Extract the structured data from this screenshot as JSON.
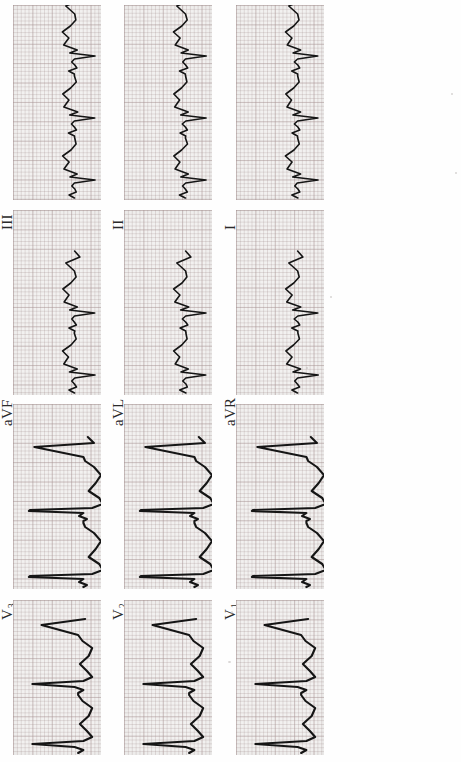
{
  "document": {
    "kind": "12-lead electrocardiogram scan",
    "orientation": "rotated 90 degrees counter-clockwise",
    "paper_color": "#f2f1f0",
    "grid_color": "#aa9696",
    "trace_color": "#151515",
    "background_color": "#fefefe"
  },
  "leads": [
    {
      "id": "III",
      "label": "III",
      "sub": "",
      "row": 0,
      "col": 0,
      "x": 13,
      "y": 5,
      "w": 86,
      "h": 193,
      "label_x": 16,
      "label_y": 237,
      "amplitude": "small",
      "morphology": "low-voltage multiphasic limb lead, notched QRS, beats every ~62px"
    },
    {
      "id": "II",
      "label": "II",
      "sub": "",
      "row": 0,
      "col": 1,
      "x": 123,
      "y": 5,
      "w": 86,
      "h": 193,
      "label_x": 126,
      "label_y": 237,
      "amplitude": "small",
      "morphology": "low-voltage multiphasic limb lead with sharp notches"
    },
    {
      "id": "I",
      "label": "I",
      "sub": "",
      "row": 0,
      "col": 2,
      "x": 237,
      "y": 5,
      "w": 86,
      "h": 193,
      "label_x": 240,
      "label_y": 237,
      "amplitude": "tall",
      "morphology": "precordial-type with tall sharp R spikes"
    },
    {
      "id": "V4",
      "label": "V",
      "sub": "4",
      "row": 0,
      "col": 3,
      "x": 349,
      "y": 5,
      "w": 86,
      "h": 193,
      "label_x": 352,
      "label_y": 237,
      "amplitude": "tall",
      "morphology": "tall narrow R waves with deep S"
    }
  ],
  "grid": {
    "rows": 4,
    "cols": 3,
    "panel_width": 86,
    "panel_height": 193,
    "small_box_px": 3.88,
    "large_box_px": 19.4
  },
  "layout": {
    "row_labels_bottom_offset": 39,
    "note": "labels sit below each panel, rotated -90 degrees"
  },
  "panels": [
    {
      "key": "III",
      "label": "III",
      "sub": "",
      "left": 13,
      "top": 5,
      "w": 88,
      "h": 195,
      "lx": 16,
      "ly": 247,
      "style": "limb"
    },
    {
      "key": "aVF",
      "label": "aVF",
      "sub": "",
      "left": 13,
      "top": 210,
      "w": 88,
      "h": 185,
      "lx": 16,
      "ly": 443,
      "style": "limb"
    },
    {
      "key": "V3",
      "label": "V",
      "sub": "3",
      "left": 13,
      "top": 404,
      "w": 88,
      "h": 185,
      "lx": 16,
      "ly": 637,
      "style": "precordial-big"
    },
    {
      "key": "V6",
      "label": "V",
      "sub": "6",
      "left": 13,
      "top": 600,
      "w": 88,
      "h": 155,
      "lx": 16,
      "ly": 800,
      "style": "precordial-mid"
    },
    {
      "key": "II",
      "label": "II",
      "sub": "",
      "left": 124,
      "top": 5,
      "w": 88,
      "h": 195,
      "lx": 127,
      "ly": 247,
      "style": "limb"
    },
    {
      "key": "aVL",
      "label": "aVL",
      "sub": "",
      "left": 124,
      "top": 210,
      "w": 88,
      "h": 185,
      "lx": 127,
      "ly": 443,
      "style": "limb"
    },
    {
      "key": "V2",
      "label": "V",
      "sub": "2",
      "left": 124,
      "top": 404,
      "w": 88,
      "h": 185,
      "lx": 127,
      "ly": 637,
      "style": "precordial-big"
    },
    {
      "key": "V5",
      "label": "V",
      "sub": "5",
      "left": 124,
      "top": 600,
      "w": 88,
      "h": 155,
      "lx": 127,
      "ly": 800,
      "style": "precordial-mid"
    },
    {
      "key": "I",
      "label": "I",
      "sub": "",
      "left": 236,
      "top": 5,
      "w": 88,
      "h": 195,
      "lx": 239,
      "ly": 247,
      "style": "limb"
    },
    {
      "key": "aVR",
      "label": "aVR",
      "sub": "",
      "left": 236,
      "top": 210,
      "w": 88,
      "h": 185,
      "lx": 239,
      "ly": 443,
      "style": "limb"
    },
    {
      "key": "V1",
      "label": "V",
      "sub": "1",
      "left": 236,
      "top": 404,
      "w": 88,
      "h": 185,
      "lx": 239,
      "ly": 637,
      "style": "precordial-big"
    },
    {
      "key": "V4",
      "label": "V",
      "sub": "4",
      "left": 236,
      "top": 600,
      "w": 88,
      "h": 155,
      "lx": 239,
      "ly": 800,
      "style": "precordial-mid"
    }
  ],
  "chart_data": {
    "type": "line",
    "xlabel": "",
    "ylabel": "",
    "note": "Traces drawn vertically because the sheet is rotated 90 degrees CCW; time runs bottom-to-top, voltage runs left-to-right.",
    "lead_order_columns": [
      [
        "III",
        "aVF",
        "V3",
        "V6"
      ],
      [
        "II",
        "aVL",
        "V2",
        "V5"
      ],
      [
        "I",
        "aVR",
        "V1",
        "V4"
      ]
    ],
    "paper_speed_mm_per_s": 25,
    "gain_mm_per_mV": 10,
    "beats_visible_per_panel": 3,
    "series": [
      {
        "name": "III",
        "amplitude_mV": 0.45,
        "qrs": "notched, low voltage"
      },
      {
        "name": "aVF",
        "amplitude_mV": 0.5,
        "qrs": "notched, low voltage"
      },
      {
        "name": "V3",
        "amplitude_mV": 1.8,
        "qrs": "tall R, deep S"
      },
      {
        "name": "V6",
        "amplitude_mV": 1.2,
        "qrs": "tall R"
      },
      {
        "name": "II",
        "amplitude_mV": 0.55,
        "qrs": "notched, low voltage"
      },
      {
        "name": "aVL",
        "amplitude_mV": 0.4,
        "qrs": "low voltage"
      },
      {
        "name": "V2",
        "amplitude_mV": 1.7,
        "qrs": "rS with tall spikes"
      },
      {
        "name": "V5",
        "amplitude_mV": 1.6,
        "qrs": "tall R"
      },
      {
        "name": "I",
        "amplitude_mV": 1.1,
        "qrs": "sharp narrow R"
      },
      {
        "name": "aVR",
        "amplitude_mV": 0.5,
        "qrs": "negative, notched"
      },
      {
        "name": "V1",
        "amplitude_mV": 1.4,
        "qrs": "rS, sharp spikes"
      },
      {
        "name": "V4",
        "amplitude_mV": 1.7,
        "qrs": "tall narrow R"
      }
    ]
  }
}
